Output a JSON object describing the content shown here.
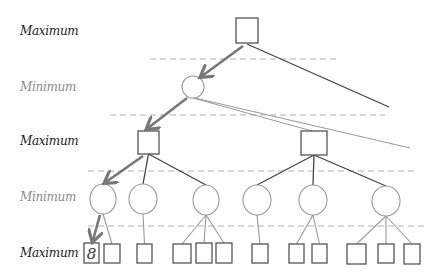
{
  "colors": {
    "max_label": "#222222",
    "min_label": "#8a8a8a",
    "node_stroke": "#555555",
    "edge": "#444444",
    "faint_edge": "#999999",
    "arrow": "#777777",
    "separator": "#b0b0b0"
  },
  "levels": [
    {
      "label": "Maximum",
      "type": "max",
      "y": 24
    },
    {
      "label": "Minimum",
      "type": "min",
      "y": 80
    },
    {
      "label": "Maximum",
      "type": "max",
      "y": 134
    },
    {
      "label": "Minimum",
      "type": "min",
      "y": 190
    },
    {
      "label": "Maximum",
      "type": "max",
      "y": 246
    }
  ],
  "separators": [
    {
      "x1": 150,
      "x2": 340,
      "y": 59
    },
    {
      "x1": 110,
      "x2": 385,
      "y": 115
    },
    {
      "x1": 88,
      "x2": 415,
      "y": 171
    },
    {
      "x1": 88,
      "x2": 425,
      "y": 226
    }
  ],
  "nodes": {
    "root": {
      "shape": "square",
      "x": 236,
      "y": 18,
      "w": 22,
      "h": 25
    },
    "min1": {
      "shape": "circle",
      "cx": 193,
      "cy": 87,
      "r": 11
    },
    "max_a": {
      "shape": "square",
      "x": 138,
      "y": 131,
      "w": 21,
      "h": 23
    },
    "max_b": {
      "shape": "square",
      "x": 301,
      "y": 131,
      "w": 26,
      "h": 24
    },
    "min_circles": [
      {
        "cx": 103,
        "cy": 199,
        "rx": 13,
        "ry": 15
      },
      {
        "cx": 143,
        "cy": 199,
        "rx": 14,
        "ry": 15
      },
      {
        "cx": 206,
        "cy": 200,
        "rx": 13,
        "ry": 15
      },
      {
        "cx": 257,
        "cy": 200,
        "rx": 14,
        "ry": 15
      },
      {
        "cx": 313,
        "cy": 200,
        "rx": 14,
        "ry": 15
      },
      {
        "cx": 386,
        "cy": 201,
        "rx": 14,
        "ry": 15
      }
    ],
    "leaves": [
      {
        "x": 84,
        "y": 243,
        "w": 15,
        "h": 20,
        "value": "8",
        "parent": 0
      },
      {
        "x": 104,
        "y": 244,
        "w": 16,
        "h": 19,
        "value": "",
        "parent": 0
      },
      {
        "x": 137,
        "y": 244,
        "w": 15,
        "h": 19,
        "value": "",
        "parent": 1
      },
      {
        "x": 173,
        "y": 244,
        "w": 18,
        "h": 19,
        "value": "",
        "parent": 2
      },
      {
        "x": 196,
        "y": 243,
        "w": 16,
        "h": 20,
        "value": "",
        "parent": 2
      },
      {
        "x": 216,
        "y": 243,
        "w": 16,
        "h": 20,
        "value": "",
        "parent": 2
      },
      {
        "x": 252,
        "y": 244,
        "w": 16,
        "h": 19,
        "value": "",
        "parent": 3
      },
      {
        "x": 289,
        "y": 244,
        "w": 15,
        "h": 19,
        "value": "",
        "parent": 4
      },
      {
        "x": 312,
        "y": 244,
        "w": 15,
        "h": 19,
        "value": "",
        "parent": 4
      },
      {
        "x": 347,
        "y": 244,
        "w": 19,
        "h": 20,
        "value": "",
        "parent": 5
      },
      {
        "x": 378,
        "y": 244,
        "w": 16,
        "h": 19,
        "value": "",
        "parent": 5
      },
      {
        "x": 404,
        "y": 244,
        "w": 16,
        "h": 20,
        "value": "",
        "parent": 5
      }
    ]
  },
  "offscreen_edges": [
    {
      "from": [
        247,
        44
      ],
      "to": [
        389,
        107
      ],
      "style": "edge"
    },
    {
      "from": [
        195,
        98
      ],
      "to": [
        410,
        148
      ],
      "style": "faint"
    },
    {
      "from": [
        193,
        98
      ],
      "to": [
        312,
        131
      ],
      "style": "faint"
    }
  ],
  "best_path": [
    {
      "from": [
        243,
        46
      ],
      "to": [
        202,
        76
      ]
    },
    {
      "from": [
        187,
        98
      ],
      "to": [
        148,
        128
      ]
    },
    {
      "from": [
        143,
        156
      ],
      "to": [
        106,
        182
      ]
    },
    {
      "from": [
        100,
        215
      ],
      "to": [
        93,
        240
      ]
    }
  ]
}
